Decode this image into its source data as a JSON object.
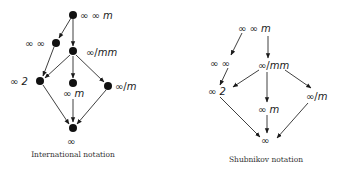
{
  "diagrams": [
    {
      "caption": "International notation",
      "nodes": {
        "top": "∞∞m",
        "inf_inf": "∞∞",
        "inf_mm": "∞/mm",
        "inf_2": "∞2",
        "inf_m": "∞m",
        "inf_slash_m": "∞/m",
        "inf": "∞"
      }
    },
    {
      "caption": "Shubnikov notation",
      "nodes": {
        "top": "∞·∞·m",
        "inf_inf": "∞:∞",
        "inf_mm": "∞/m·m",
        "inf_2": "∞:2",
        "inf_m": "∞·m",
        "inf_slash_m": "∞/m",
        "inf": "∞"
      }
    }
  ],
  "labels": {
    "intl": {
      "top_a": "∞ ∞ ",
      "top_b": "m",
      "inf_inf": "∞ ∞",
      "inf_mm_a": "∞/",
      "inf_mm_b": "mm",
      "inf_2_a": "∞ ",
      "inf_2_b": "2",
      "inf_m_a": "∞ ",
      "inf_m_b": "m",
      "inf_slash_m_a": "∞/",
      "inf_slash_m_b": "m",
      "inf": "∞"
    },
    "shub": {
      "top_a": "∞ ∞ ",
      "top_b": "m",
      "inf_inf": "∞ ∞",
      "inf_mm_a": "∞/",
      "inf_mm_b": "mm",
      "inf_2_a": "∞ ",
      "inf_2_b": "2",
      "inf_m_a": "∞ ",
      "inf_m_b": "m",
      "inf_slash_m_a": "∞/",
      "inf_slash_m_b": "m",
      "inf": "∞"
    }
  },
  "edges": [
    [
      "top",
      "inf_inf"
    ],
    [
      "top",
      "inf_mm"
    ],
    [
      "inf_inf",
      "inf_2"
    ],
    [
      "inf_mm",
      "inf_2"
    ],
    [
      "inf_mm",
      "inf_m"
    ],
    [
      "inf_mm",
      "inf_slash_m"
    ],
    [
      "inf_2",
      "inf"
    ],
    [
      "inf_m",
      "inf"
    ],
    [
      "inf_slash_m",
      "inf"
    ]
  ]
}
